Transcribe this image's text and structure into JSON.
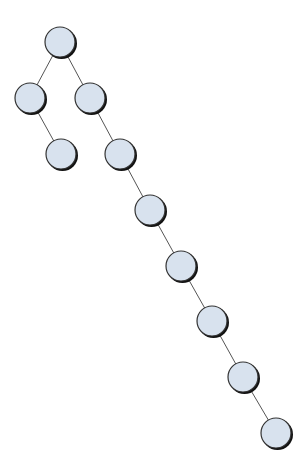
{
  "diagram": {
    "type": "tree",
    "style": {
      "node_fill": "#D8E2EE",
      "node_stroke": "#333333",
      "shadow_color": "#111111",
      "edge_color": "#555555",
      "node_radius": 15
    },
    "nodes": [
      {
        "id": "n0",
        "x": 60,
        "y": 42
      },
      {
        "id": "n1",
        "x": 30,
        "y": 98
      },
      {
        "id": "n2",
        "x": 90,
        "y": 98
      },
      {
        "id": "n3",
        "x": 61,
        "y": 154
      },
      {
        "id": "n4",
        "x": 120,
        "y": 154
      },
      {
        "id": "n5",
        "x": 150,
        "y": 210
      },
      {
        "id": "n6",
        "x": 181,
        "y": 266
      },
      {
        "id": "n7",
        "x": 212,
        "y": 321
      },
      {
        "id": "n8",
        "x": 243,
        "y": 377
      },
      {
        "id": "n9",
        "x": 276,
        "y": 433
      }
    ],
    "edges": [
      {
        "from": "n0",
        "to": "n1"
      },
      {
        "from": "n0",
        "to": "n2"
      },
      {
        "from": "n1",
        "to": "n3"
      },
      {
        "from": "n2",
        "to": "n4"
      },
      {
        "from": "n4",
        "to": "n5"
      },
      {
        "from": "n5",
        "to": "n6"
      },
      {
        "from": "n6",
        "to": "n7"
      },
      {
        "from": "n7",
        "to": "n8"
      },
      {
        "from": "n8",
        "to": "n9"
      }
    ]
  }
}
